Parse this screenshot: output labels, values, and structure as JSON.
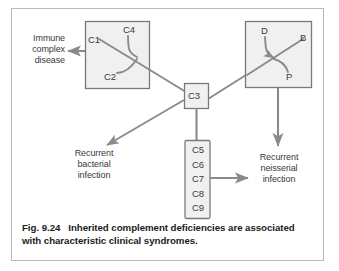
{
  "figure": {
    "number": "Fig. 9.24",
    "caption_gap": "   ",
    "caption": "Inherited complement deficiencies are associated with characteristic clinical syndromes.",
    "caption_line1": "Inherited complement deficiencies are associated",
    "caption_line2": "with characteristic clinical syndromes."
  },
  "colors": {
    "frame_border": "#b9b9b9",
    "box_border": "#7a7a7a",
    "box_fill": "#f0f0f0",
    "line": "#8a8a8a",
    "text": "#3a3a3a",
    "caption_text": "#1b1b1b",
    "background": "#ffffff"
  },
  "nodes": {
    "classical_box": {
      "name": "classical-pathway-box",
      "components": [
        "C1",
        "C4",
        "C2"
      ]
    },
    "alternative_box": {
      "name": "alternative-pathway-box",
      "components": [
        "D",
        "B",
        "P"
      ]
    },
    "c3_box": {
      "name": "c3-box",
      "label": "C3"
    },
    "mac_box": {
      "name": "terminal-components-box",
      "components": [
        "C5",
        "C6",
        "C7",
        "C8",
        "C9"
      ],
      "label": "C5\nC6\nC7\nC8\nC9"
    }
  },
  "outcomes": [
    {
      "id": "immune-complex-disease",
      "lines": [
        "Immune",
        "complex",
        "disease"
      ],
      "text": "Immune\ncomplex\ndisease"
    },
    {
      "id": "recurrent-bacterial-infection",
      "lines": [
        "Recurrent",
        "bacterial",
        "infection"
      ],
      "text": "Recurrent\nbacterial\ninfection"
    },
    {
      "id": "recurrent-neisserial-infection",
      "lines": [
        "Recurrent",
        "neisserial",
        "infection"
      ],
      "text": "Recurrent\nneisserial\ninfection"
    }
  ]
}
